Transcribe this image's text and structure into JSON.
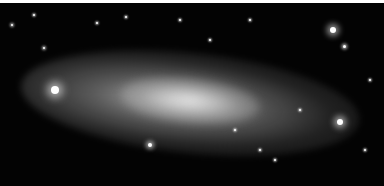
{
  "image": {
    "subject": "spiral galaxy viewed at an inclined angle against a star field",
    "border_top_color": "#ffffff",
    "background_color": "#030303",
    "galaxy_color": "#c8c8c8",
    "stars": [
      {
        "x": 333,
        "y": 30,
        "r": 3
      },
      {
        "x": 344,
        "y": 46,
        "r": 1.5
      },
      {
        "x": 55,
        "y": 90,
        "r": 4
      },
      {
        "x": 340,
        "y": 122,
        "r": 3
      },
      {
        "x": 150,
        "y": 145,
        "r": 2
      },
      {
        "x": 12,
        "y": 25,
        "r": 1.2
      },
      {
        "x": 34,
        "y": 15,
        "r": 1
      },
      {
        "x": 126,
        "y": 17,
        "r": 1
      },
      {
        "x": 97,
        "y": 23,
        "r": 1
      },
      {
        "x": 44,
        "y": 48,
        "r": 1.2
      },
      {
        "x": 260,
        "y": 150,
        "r": 1
      },
      {
        "x": 275,
        "y": 160,
        "r": 1
      },
      {
        "x": 365,
        "y": 150,
        "r": 1
      },
      {
        "x": 235,
        "y": 130,
        "r": 1
      },
      {
        "x": 300,
        "y": 110,
        "r": 1
      },
      {
        "x": 370,
        "y": 80,
        "r": 1
      },
      {
        "x": 210,
        "y": 40,
        "r": 1
      },
      {
        "x": 180,
        "y": 20,
        "r": 1
      },
      {
        "x": 250,
        "y": 20,
        "r": 1
      }
    ]
  }
}
